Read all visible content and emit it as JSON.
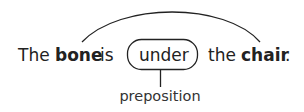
{
  "diagram": {
    "type": "grammar-annotation",
    "sentence": {
      "w1": "The",
      "w2": "bone",
      "w3": "is",
      "w4": "under",
      "w5": "the",
      "w6": "chair",
      "w7": "."
    },
    "bold_words": [
      "bone",
      "chair"
    ],
    "boxed_word": "under",
    "label": "preposition",
    "relation": {
      "from": "bone",
      "to": "chair",
      "via": "under"
    },
    "colors": {
      "text": "#222222",
      "lines": "#222222",
      "background": "#ffffff"
    }
  }
}
